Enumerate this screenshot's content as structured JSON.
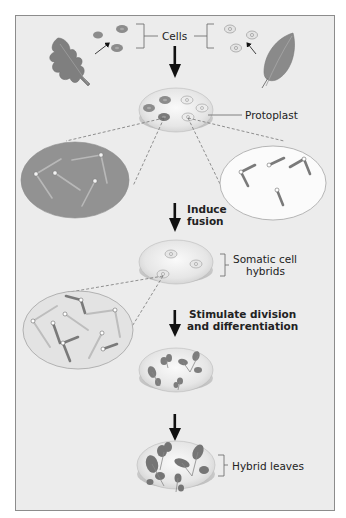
{
  "diagram": {
    "colors": {
      "background": "#ececec",
      "border": "#8c8c8c",
      "dark_leaf": "#7f7f7f",
      "light_leaf": "#8a8a8a",
      "dark_cell": "#8c8c8c",
      "light_cell": "#d8d8d8",
      "dish_rim": "#c8c8c8",
      "arrow": "#111111"
    },
    "labels": {
      "cells": "Cells",
      "protoplast": "Protoplast",
      "induce_fusion_line1": "Induce",
      "induce_fusion_line2": "fusion",
      "somatic_line1": "Somatic cell",
      "somatic_line2": "hybrids",
      "stimulate_line1": "Stimulate division",
      "stimulate_line2": "and differentiation",
      "hybrid_leaves": "Hybrid leaves"
    },
    "steps": [
      {
        "id": "source-plants",
        "description": "Two parent plants with leaf cells"
      },
      {
        "id": "protoplasts",
        "description": "Protoplasts in dish"
      },
      {
        "id": "fusion",
        "description": "Induce fusion"
      },
      {
        "id": "hybrids",
        "description": "Somatic cell hybrids"
      },
      {
        "id": "division",
        "description": "Stimulate division and differentiation"
      },
      {
        "id": "hybrid-leaves",
        "description": "Hybrid leaves"
      }
    ]
  }
}
